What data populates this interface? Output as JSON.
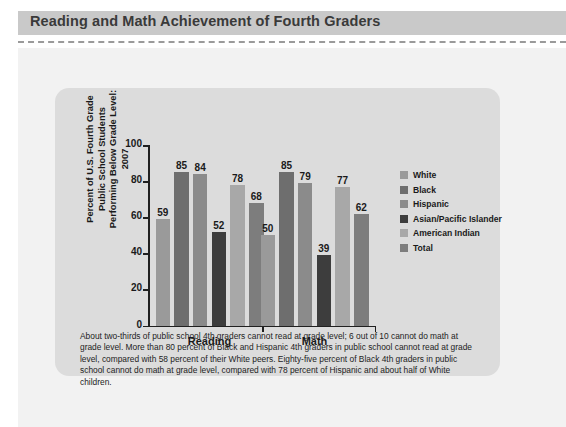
{
  "header": {
    "title": "Reading and Math Achievement of Fourth Graders",
    "bar_color": "#c9c9c9",
    "rule_style": "dashed"
  },
  "chart_data": {
    "type": "bar",
    "title": "Reading and Math Achievement of Fourth Graders",
    "xlabel": "",
    "ylabel": "Percent of U.S. Fourth Grade Public School Students Performing Below Grade Level: 2007",
    "ylim": [
      0,
      100
    ],
    "yticks": [
      0,
      20,
      40,
      60,
      80,
      100
    ],
    "grid": false,
    "legend_position": "right",
    "categories": [
      "Reading",
      "Math"
    ],
    "series": [
      {
        "name": "White",
        "color": "#9a9a9a",
        "values": [
          59,
          50
        ]
      },
      {
        "name": "Black",
        "color": "#6e6e6e",
        "values": [
          85,
          85
        ]
      },
      {
        "name": "Hispanic",
        "color": "#8b8b8b",
        "values": [
          84,
          79
        ]
      },
      {
        "name": "Asian/Pacific Islander",
        "color": "#3d3d3d",
        "values": [
          52,
          39
        ]
      },
      {
        "name": "American Indian",
        "color": "#a8a8a8",
        "values": [
          78,
          77
        ]
      },
      {
        "name": "Total",
        "color": "#7d7d7d",
        "values": [
          68,
          62
        ]
      }
    ]
  },
  "caption": {
    "text": "About two-thirds of public school 4th graders cannot read at grade level; 6 out of 10 cannot do math at grade level. More than 80 percent of Black and Hispanic 4th graders in public school cannot read at grade level, compared with 58 percent of their White peers. Eighty-five percent of Black 4th graders in public school cannot do math at grade level, compared with 78 percent of Hispanic and about half of White children."
  },
  "colors": {
    "page_background": "#f2f2f2",
    "card_background": "#dcdcdc",
    "axis": "#202020",
    "text": "#1a1a1a"
  }
}
